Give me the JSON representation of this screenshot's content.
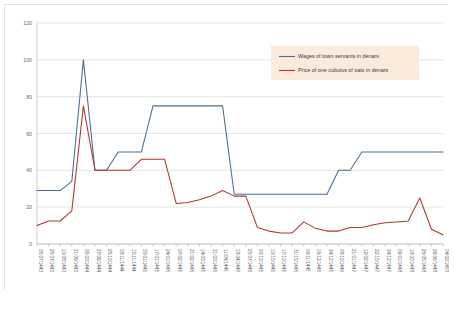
{
  "chart_data": {
    "type": "line",
    "title": "",
    "xlabel": "",
    "ylabel": "",
    "ylim": [
      0,
      120
    ],
    "yticks": [
      0,
      20,
      40,
      60,
      80,
      100,
      120
    ],
    "grid": true,
    "legend_position": "upper right",
    "categories": [
      "05/07/1443",
      "25/07/1443",
      "10/08/1443",
      "21/09/1443",
      "05/03/1444",
      "27/09/1444",
      "25/10/1444",
      "08/11/1444",
      "15/11/1444",
      "30/01/1445",
      "17/01/1445",
      "24/01/1445",
      "07/02/1445",
      "21/02/1445",
      "14/03/1445",
      "21/03/1445",
      "11/04/1445",
      "18/04/1445",
      "25/07/1445",
      "03/10/1445",
      "10/10/1445",
      "17/10/1445",
      "31/10/1445",
      "09/11/1445",
      "19/12/1445",
      "24/12/1445",
      "08/10/1446",
      "21/01/1447",
      "12/02/1447",
      "22/10/1447",
      "24/12/1447",
      "09/01/1448",
      "18/03/1448",
      "26/05/1448",
      "29/06/1448",
      "04/02/1453"
    ],
    "series": [
      {
        "name": "Wages of town servants in denars",
        "color": "#4A6C96",
        "values": [
          29,
          29,
          29,
          34,
          100,
          40,
          40,
          50,
          50,
          50,
          75,
          75,
          75,
          75,
          75,
          75,
          75,
          27,
          27,
          27,
          27,
          27,
          27,
          27,
          27,
          27,
          40,
          40,
          50,
          50,
          50,
          50,
          50,
          50,
          50,
          50
        ]
      },
      {
        "name": "Price of one cubulus of oats in denars",
        "color": "#A83A2A",
        "values": [
          10,
          12.5,
          12.5,
          18,
          75,
          40,
          40,
          40,
          40,
          46,
          46,
          46,
          22,
          22.5,
          24,
          26,
          29,
          26,
          26,
          9,
          7,
          6,
          6,
          12,
          8.5,
          7,
          7,
          9,
          9,
          10.5,
          11.5,
          12,
          12.5,
          25,
          8,
          5
        ]
      }
    ]
  },
  "legend": {
    "entries": [
      {
        "label": "Wages of town servants in denars",
        "color": "#4A6C96"
      },
      {
        "label": "Price of one cubulus of oats in denars",
        "color": "#A83A2A"
      }
    ],
    "background": "#FAEBDC"
  },
  "colors": {
    "series_blue": "#4A6C96",
    "series_red": "#A83A2A",
    "gridline": "#d4d4d4",
    "frame_border": "#e2e2e2",
    "tick_text": "#5e5e5e"
  }
}
